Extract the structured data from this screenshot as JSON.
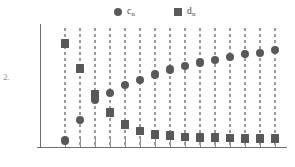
{
  "figure": {
    "problem_number": "2.",
    "background_color": "#ffffff",
    "marker_color": "#585858",
    "axis_color": "#6f6f6f",
    "stem_color": "#9a9a9a"
  },
  "legend": {
    "position": "top-center",
    "items": [
      {
        "name": "c",
        "subscript": "n",
        "marker": "circle",
        "label": "c",
        "color": "#5a5a5a"
      },
      {
        "name": "d",
        "subscript": "n",
        "marker": "square",
        "label": "d",
        "color": "#5a5a5a"
      }
    ]
  },
  "chart_data": {
    "type": "scatter",
    "title": "",
    "subtitle": "",
    "xlabel": "",
    "ylabel": "",
    "grid": false,
    "legend_position": "top-center",
    "annotations": [
      "2."
    ],
    "x": [
      1,
      2,
      3,
      4,
      5,
      6,
      7,
      8,
      9,
      10,
      11,
      12,
      13,
      14,
      15
    ],
    "xlim": [
      0.4,
      15.6
    ],
    "ylim": [
      0,
      1
    ],
    "xticks": [
      1,
      2,
      3,
      4,
      5,
      6,
      7,
      8,
      9,
      10,
      11,
      12,
      13,
      14,
      15
    ],
    "xticklabels": [
      "",
      "",
      "",
      "",
      "",
      "",
      "",
      "",
      "",
      "",
      "",
      "",
      "",
      "",
      ""
    ],
    "yticks": [],
    "yticklabels": [],
    "series": [
      {
        "name": "c",
        "legend_label": "c_n",
        "marker": "circle",
        "color": "#585858",
        "values": [
          0.055,
          0.225,
          0.4,
          0.455,
          0.52,
          0.565,
          0.61,
          0.65,
          0.68,
          0.71,
          0.73,
          0.755,
          0.78,
          0.79,
          0.815
        ]
      },
      {
        "name": "d",
        "legend_label": "d_n",
        "marker": "square",
        "color": "#585858",
        "values": [
          0.87,
          0.66,
          0.44,
          0.29,
          0.19,
          0.135,
          0.105,
          0.095,
          0.085,
          0.08,
          0.078,
          0.075,
          0.073,
          0.071,
          0.07
        ]
      }
    ]
  }
}
